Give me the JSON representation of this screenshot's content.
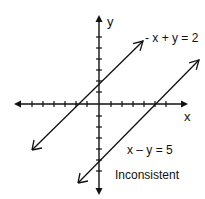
{
  "diagram": {
    "axes": {
      "x_label": "x",
      "y_label": "y"
    },
    "lines": [
      {
        "equation": "- x + y = 2",
        "slope": 1,
        "y_intercept": 2,
        "x_intercept": -2
      },
      {
        "equation": "x – y = 5",
        "slope": 1,
        "y_intercept": -5,
        "x_intercept": 5
      }
    ],
    "caption": "Inconsistent"
  }
}
